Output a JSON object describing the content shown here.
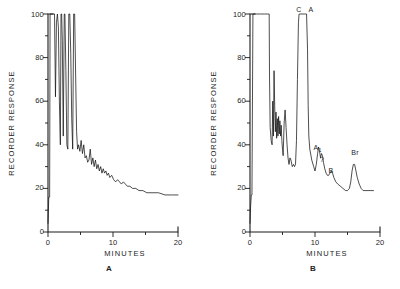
{
  "figure": {
    "panel_captions": [
      "A",
      "B"
    ],
    "background_color": "#ffffff",
    "trace_color": "#141414"
  },
  "chart_data": [
    {
      "type": "line",
      "panel": "A",
      "title": "A",
      "xlabel": "MINUTES",
      "ylabel": "RECORDER RESPONSE",
      "xlim": [
        0,
        20
      ],
      "ylim": [
        0,
        100
      ],
      "xticks": [
        0,
        10,
        20
      ],
      "xticklabels": [
        "0",
        "10",
        "20"
      ],
      "xminorticks": [
        5,
        15
      ],
      "yticks": [
        0,
        20,
        40,
        60,
        80,
        100
      ],
      "yticklabels": [
        "0",
        "20",
        "40",
        "60",
        "80",
        "100"
      ],
      "yminorticks": [
        10,
        30,
        50,
        70,
        90
      ],
      "grid": false,
      "legend": "none",
      "annotations": [],
      "description": "Chromatogram with several off-scale spikes at the solvent front followed by a decaying baseline.",
      "x": [
        0.0,
        0.12,
        0.25,
        0.32,
        0.4,
        0.6,
        0.8,
        1.0,
        1.15,
        1.3,
        1.45,
        1.6,
        1.75,
        1.9,
        2.0,
        2.1,
        2.2,
        2.35,
        2.5,
        2.6,
        2.75,
        2.9,
        3.05,
        3.2,
        3.35,
        3.5,
        3.65,
        3.8,
        3.95,
        4.1,
        4.25,
        4.4,
        4.55,
        4.7,
        4.9,
        5.1,
        5.3,
        5.5,
        5.7,
        5.9,
        6.1,
        6.3,
        6.5,
        6.7,
        6.9,
        7.1,
        7.3,
        7.5,
        7.7,
        7.9,
        8.1,
        8.3,
        8.5,
        8.7,
        8.9,
        9.1,
        9.3,
        9.5,
        9.8,
        10.1,
        10.4,
        10.7,
        11.0,
        11.3,
        11.6,
        11.9,
        12.2,
        12.6,
        13.0,
        13.5,
        14.0,
        14.6,
        15.2,
        16.0,
        17.0,
        18.0,
        19.0,
        20.0
      ],
      "y": [
        4,
        16,
        16,
        100,
        100,
        100,
        100,
        100,
        62,
        96,
        100,
        94,
        60,
        40,
        100,
        100,
        88,
        44,
        100,
        100,
        74,
        40,
        38,
        100,
        100,
        82,
        52,
        38,
        100,
        100,
        72,
        46,
        38,
        40,
        37,
        42,
        36,
        40,
        34,
        35,
        32,
        33,
        38,
        31,
        34,
        30,
        33,
        29,
        31,
        28,
        30,
        27,
        29,
        27,
        28,
        26,
        27,
        25,
        26,
        24,
        23,
        24,
        23,
        22,
        23,
        22,
        21,
        21,
        20,
        20,
        19,
        19,
        18,
        18,
        18,
        17,
        17,
        17
      ]
    },
    {
      "type": "line",
      "panel": "B",
      "title": "B",
      "xlabel": "MINUTES",
      "ylabel": "RECORDER RESPONSE",
      "xlim": [
        0,
        20
      ],
      "ylim": [
        0,
        100
      ],
      "xticks": [
        0,
        10,
        20
      ],
      "xticklabels": [
        "0",
        "10",
        "20"
      ],
      "xminorticks": [
        5,
        15
      ],
      "yticks": [
        0,
        20,
        40,
        60,
        80,
        100
      ],
      "yticklabels": [
        "0",
        "20",
        "40",
        "60",
        "80",
        "100"
      ],
      "yminorticks": [
        10,
        30,
        50,
        70,
        90
      ],
      "grid": false,
      "legend": "none",
      "annotations": [
        {
          "label": "C",
          "x": 7.6,
          "y": 100
        },
        {
          "label": "A",
          "x": 8.6,
          "y": 100
        },
        {
          "label": "A",
          "sub": "1",
          "x": 10.6,
          "y": 40
        },
        {
          "label": "?",
          "x": 11.2,
          "y": 35
        },
        {
          "label": "B",
          "x": 12.4,
          "y": 30
        },
        {
          "label": "Br",
          "x": 16.0,
          "y": 38
        }
      ],
      "description": "Chromatogram with an off-scale solvent block, a multiplet cluster, an off-scale C/A peak, then resolved A1, ?, B and Br peaks.",
      "x": [
        0.0,
        0.1,
        0.2,
        0.3,
        0.45,
        1.0,
        1.6,
        2.2,
        2.7,
        2.95,
        3.0,
        3.1,
        3.25,
        3.4,
        3.5,
        3.6,
        3.7,
        3.8,
        3.9,
        4.0,
        4.1,
        4.2,
        4.3,
        4.4,
        4.5,
        4.6,
        4.7,
        4.8,
        4.9,
        5.0,
        5.1,
        5.25,
        5.4,
        5.55,
        5.7,
        5.85,
        6.0,
        6.15,
        6.3,
        6.5,
        6.7,
        6.85,
        7.0,
        7.15,
        7.3,
        7.45,
        7.55,
        7.6,
        7.7,
        8.0,
        8.4,
        8.7,
        8.85,
        8.95,
        9.05,
        9.2,
        9.5,
        9.8,
        10.0,
        10.2,
        10.4,
        10.55,
        10.7,
        10.85,
        11.0,
        11.15,
        11.3,
        11.5,
        11.7,
        11.9,
        12.1,
        12.3,
        12.5,
        12.7,
        12.9,
        13.2,
        13.5,
        13.9,
        14.3,
        14.7,
        15.0,
        15.3,
        15.5,
        15.7,
        15.9,
        16.1,
        16.3,
        16.5,
        16.8,
        17.1,
        17.4,
        17.7,
        18.0,
        18.3,
        18.6,
        19.0
      ],
      "y": [
        4,
        12,
        17,
        17,
        100,
        100,
        100,
        100,
        100,
        100,
        72,
        48,
        42,
        40,
        60,
        44,
        74,
        58,
        46,
        55,
        43,
        52,
        44,
        53,
        45,
        51,
        44,
        49,
        42,
        38,
        35,
        50,
        56,
        48,
        40,
        34,
        31,
        34,
        33,
        30,
        31,
        30,
        31,
        42,
        70,
        96,
        100,
        100,
        100,
        100,
        100,
        100,
        84,
        58,
        44,
        38,
        33,
        30,
        28,
        31,
        36,
        39,
        37,
        34,
        36,
        35,
        32,
        29,
        27,
        26,
        26,
        27,
        28,
        27,
        25,
        23,
        22,
        21,
        20,
        19,
        19,
        20,
        23,
        28,
        31,
        31,
        28,
        25,
        22,
        20,
        19,
        19,
        19,
        19,
        19,
        19
      ]
    }
  ]
}
